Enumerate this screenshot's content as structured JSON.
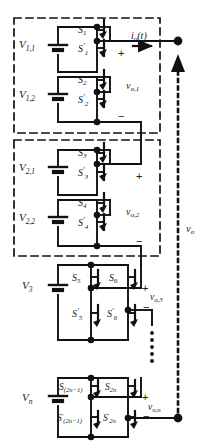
{
  "figure": {
    "type": "circuit-schematic",
    "background_color": "#ffffff",
    "line_color": "#111111"
  },
  "output": {
    "current_label": "i",
    "current_sub": "o",
    "current_arg": "(t)",
    "total_voltage_label": "v",
    "total_voltage_sub": "o"
  },
  "modules": [
    {
      "id": "module-1",
      "boxed": true,
      "output_label": "v",
      "output_sub": "o,1",
      "plus": "+",
      "minus": "−",
      "cells": [
        {
          "source_label": "V",
          "source_sub": "1,1",
          "switch_top": "S",
          "switch_top_sub": "1",
          "switch_bottom": "S",
          "switch_bottom_sub": "1",
          "switch_bottom_prime": "′"
        },
        {
          "source_label": "V",
          "source_sub": "1,2",
          "switch_top": "S",
          "switch_top_sub": "2",
          "switch_bottom": "S",
          "switch_bottom_sub": "2",
          "switch_bottom_prime": "′"
        }
      ]
    },
    {
      "id": "module-2",
      "boxed": true,
      "output_label": "v",
      "output_sub": "o,2",
      "plus": "+",
      "minus": "−",
      "cells": [
        {
          "source_label": "V",
          "source_sub": "2,1",
          "switch_top": "S",
          "switch_top_sub": "3",
          "switch_bottom": "S",
          "switch_bottom_sub": "3",
          "switch_bottom_prime": "′"
        },
        {
          "source_label": "V",
          "source_sub": "2,2",
          "switch_top": "S",
          "switch_top_sub": "4",
          "switch_bottom": "S",
          "switch_bottom_sub": "4",
          "switch_bottom_prime": "′"
        }
      ]
    },
    {
      "id": "module-3",
      "boxed": false,
      "output_label": "v",
      "output_sub": "o,3",
      "plus": "+",
      "minus": "−",
      "source_label": "V",
      "source_sub": "3",
      "switches": {
        "top_left": "S",
        "top_left_sub": "5",
        "top_right": "S",
        "top_right_sub": "6",
        "bottom_left": "S",
        "bottom_left_sub": "5",
        "bottom_left_prime": "′",
        "bottom_right": "S",
        "bottom_right_sub": "6",
        "bottom_right_prime": "′"
      }
    },
    {
      "id": "module-n",
      "boxed": false,
      "output_label": "v",
      "output_sub": "o,n",
      "plus": "+",
      "minus": "−",
      "source_label": "V",
      "source_sub": "n",
      "switches": {
        "top_left": "S",
        "top_left_sub": "(2n−1)",
        "top_right": "S",
        "top_right_sub": "2n",
        "bottom_left": "S",
        "bottom_left_sub": "(2n−1)",
        "bottom_left_prime": "′",
        "bottom_right": "S",
        "bottom_right_sub": "2n",
        "bottom_right_prime": "′"
      }
    }
  ],
  "continuation": {
    "symbol": "vertical-dots",
    "meaning": "additional cascaded modules"
  }
}
